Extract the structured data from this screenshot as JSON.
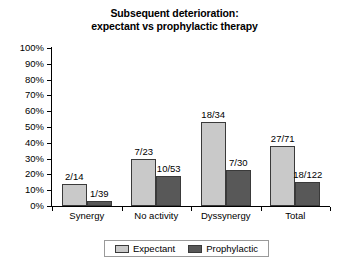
{
  "chart_data": {
    "type": "bar",
    "title": "Subsequent deterioration: expectant vs prophylactic therapy",
    "title_lines": [
      "Subsequent deterioration:",
      "expectant vs prophylactic therapy"
    ],
    "categories": [
      "Synergy",
      "No activity",
      "Dyssynergy",
      "Total"
    ],
    "series": [
      {
        "name": "Expectant",
        "color": "#c9c9c9",
        "values": [
          14,
          30,
          53,
          38
        ],
        "labels": [
          "2/14",
          "7/23",
          "18/34",
          "27/71"
        ]
      },
      {
        "name": "Prophylactic",
        "color": "#585858",
        "values": [
          3,
          19,
          23,
          15
        ],
        "labels": [
          "1/39",
          "10/53",
          "7/30",
          "18/122"
        ]
      }
    ],
    "xlabel": "",
    "ylabel": "",
    "ylim": [
      0,
      100
    ],
    "yticks": [
      0,
      10,
      20,
      30,
      40,
      50,
      60,
      70,
      80,
      90,
      100
    ],
    "ytick_labels": [
      "0%",
      "10%",
      "20%",
      "30%",
      "40%",
      "50%",
      "60%",
      "70%",
      "80%",
      "90%",
      "100%"
    ],
    "grid": false,
    "legend_position": "bottom-center"
  },
  "legend": {
    "entries": [
      {
        "label": "Expectant"
      },
      {
        "label": "Prophylactic"
      }
    ]
  }
}
